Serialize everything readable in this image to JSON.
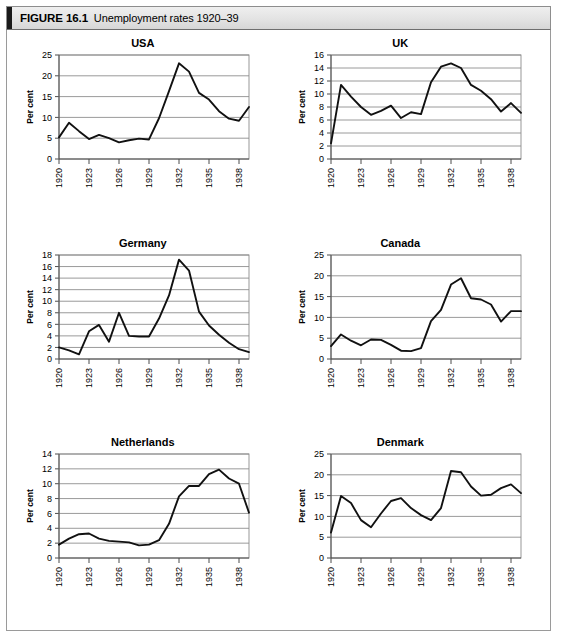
{
  "figure": {
    "label": "FIGURE 16.1",
    "title": "Unemployment rates 1920–39"
  },
  "common": {
    "ylabel": "Per cent",
    "xtick_labels": [
      "1920",
      "1923",
      "1926",
      "1929",
      "1932",
      "1935",
      "1938"
    ],
    "xtick_years": [
      1920,
      1923,
      1926,
      1929,
      1932,
      1935,
      1938
    ],
    "line_color": "#111111",
    "grid_color": "#808080",
    "axis_color": "#4d4d4d"
  },
  "chart_data": [
    {
      "type": "line",
      "title": "USA",
      "xlabel": "",
      "ylabel": "Per cent",
      "xlim": [
        1920,
        1939
      ],
      "ylim": [
        0,
        25
      ],
      "yticks": [
        0,
        5,
        10,
        15,
        20,
        25
      ],
      "grid": true,
      "legend": "none",
      "x": [
        1920,
        1921,
        1922,
        1923,
        1924,
        1925,
        1926,
        1927,
        1928,
        1929,
        1930,
        1931,
        1932,
        1933,
        1934,
        1935,
        1936,
        1937,
        1938,
        1939
      ],
      "values": [
        5.2,
        8.7,
        6.7,
        4.8,
        5.8,
        5.0,
        4.0,
        4.5,
        4.9,
        4.7,
        9.8,
        16.3,
        23.0,
        21.0,
        15.9,
        14.3,
        11.5,
        9.7,
        9.2,
        12.5
      ]
    },
    {
      "type": "line",
      "title": "UK",
      "xlabel": "",
      "ylabel": "Per cent",
      "xlim": [
        1920,
        1939
      ],
      "ylim": [
        0,
        16
      ],
      "yticks": [
        0,
        2,
        4,
        6,
        8,
        10,
        12,
        14,
        16
      ],
      "grid": true,
      "legend": "none",
      "x": [
        1920,
        1921,
        1922,
        1923,
        1924,
        1925,
        1926,
        1927,
        1928,
        1929,
        1930,
        1931,
        1932,
        1933,
        1934,
        1935,
        1936,
        1937,
        1938,
        1939
      ],
      "values": [
        2.4,
        11.4,
        9.6,
        8.0,
        6.8,
        7.4,
        8.2,
        6.3,
        7.2,
        6.9,
        11.8,
        14.2,
        14.7,
        14.0,
        11.4,
        10.5,
        9.2,
        7.3,
        8.6,
        7.1
      ]
    },
    {
      "type": "line",
      "title": "Germany",
      "xlabel": "",
      "ylabel": "Per cent",
      "xlim": [
        1920,
        1939
      ],
      "ylim": [
        0,
        18
      ],
      "yticks": [
        0,
        2,
        4,
        6,
        8,
        10,
        12,
        14,
        16,
        18
      ],
      "grid": true,
      "legend": "none",
      "x": [
        1920,
        1921,
        1922,
        1923,
        1924,
        1925,
        1926,
        1927,
        1928,
        1929,
        1930,
        1931,
        1932,
        1933,
        1934,
        1935,
        1936,
        1937,
        1938,
        1939
      ],
      "values": [
        2.0,
        1.5,
        0.8,
        4.8,
        5.9,
        3.0,
        8.0,
        4.0,
        3.9,
        3.9,
        7.0,
        11.0,
        17.2,
        15.3,
        8.2,
        5.8,
        4.2,
        2.8,
        1.7,
        1.2
      ]
    },
    {
      "type": "line",
      "title": "Canada",
      "xlabel": "",
      "ylabel": "Per cent",
      "xlim": [
        1920,
        1939
      ],
      "ylim": [
        0,
        25
      ],
      "yticks": [
        0,
        5,
        10,
        15,
        20,
        25
      ],
      "grid": true,
      "legend": "none",
      "x": [
        1920,
        1921,
        1922,
        1923,
        1924,
        1925,
        1926,
        1927,
        1928,
        1929,
        1930,
        1931,
        1932,
        1933,
        1934,
        1935,
        1936,
        1937,
        1938,
        1939
      ],
      "values": [
        3.1,
        5.9,
        4.4,
        3.3,
        4.7,
        4.6,
        3.4,
        2.0,
        1.9,
        2.6,
        9.1,
        11.8,
        17.9,
        19.4,
        14.6,
        14.3,
        13.1,
        9.0,
        11.5,
        11.5
      ]
    },
    {
      "type": "line",
      "title": "Netherlands",
      "xlabel": "",
      "ylabel": "Per cent",
      "xlim": [
        1920,
        1939
      ],
      "ylim": [
        0,
        14
      ],
      "yticks": [
        0,
        2,
        4,
        6,
        8,
        10,
        12,
        14
      ],
      "grid": true,
      "legend": "none",
      "x": [
        1920,
        1921,
        1922,
        1923,
        1924,
        1925,
        1926,
        1927,
        1928,
        1929,
        1930,
        1931,
        1932,
        1933,
        1934,
        1935,
        1936,
        1937,
        1938,
        1939
      ],
      "values": [
        1.8,
        2.6,
        3.2,
        3.3,
        2.6,
        2.3,
        2.2,
        2.1,
        1.7,
        1.8,
        2.4,
        4.6,
        8.3,
        9.7,
        9.7,
        11.3,
        11.9,
        10.7,
        10.0,
        6.1
      ]
    },
    {
      "type": "line",
      "title": "Denmark",
      "xlabel": "",
      "ylabel": "Per cent",
      "xlim": [
        1920,
        1939
      ],
      "ylim": [
        0,
        25
      ],
      "yticks": [
        0,
        5,
        10,
        15,
        20,
        25
      ],
      "grid": true,
      "legend": "none",
      "x": [
        1920,
        1921,
        1922,
        1923,
        1924,
        1925,
        1926,
        1927,
        1928,
        1929,
        1930,
        1931,
        1932,
        1933,
        1934,
        1935,
        1936,
        1937,
        1938,
        1939
      ],
      "values": [
        6.1,
        14.9,
        13.2,
        9.1,
        7.4,
        10.7,
        13.7,
        14.4,
        12.0,
        10.3,
        9.1,
        12.0,
        20.9,
        20.6,
        17.2,
        15.0,
        15.2,
        16.8,
        17.7,
        15.6
      ]
    }
  ]
}
